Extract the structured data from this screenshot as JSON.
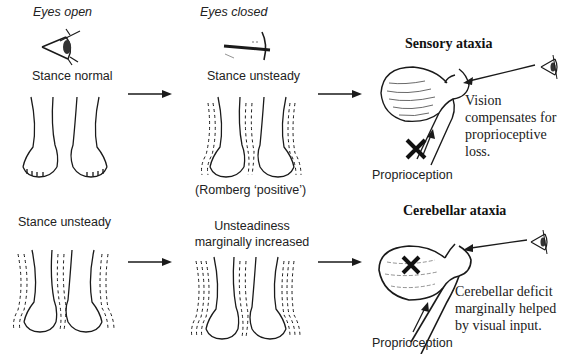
{
  "columns": {
    "eyes_open": "Eyes open",
    "eyes_closed": "Eyes closed"
  },
  "row_sensory": {
    "eyes_open_stance": "Stance normal",
    "eyes_closed_stance": "Stance unsteady",
    "romberg_note": "(Romberg ‘positive’)",
    "title": "Sensory ataxia",
    "explanation_lines": [
      "Vision",
      "compensates for",
      "proprioceptive",
      "loss."
    ],
    "input_label": "Proprioception"
  },
  "row_cerebellar": {
    "eyes_open_stance": "Stance unsteady",
    "eyes_closed_stance_lines": [
      "Unsteadiness",
      "marginally increased"
    ],
    "title": "Cerebellar ataxia",
    "explanation_lines": [
      "Cerebellar deficit",
      "marginally helped",
      "by visual input."
    ],
    "input_label": "Proprioception"
  },
  "icons": {
    "open_eye": "eye-open-icon",
    "closed_eye": "eye-closed-icon",
    "lesion_mark": "x-mark-icon"
  },
  "colors": {
    "ink": "#1a1a1a",
    "background": "#ffffff"
  }
}
